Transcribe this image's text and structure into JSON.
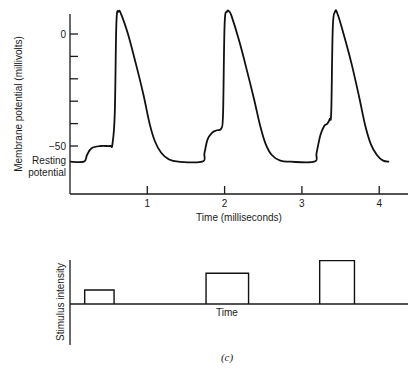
{
  "chart_data": [
    {
      "type": "line",
      "title": "",
      "xlabel": "Time (milliseconds)",
      "ylabel": "Membrane potential (millivolts)",
      "xlim": [
        0,
        4.4
      ],
      "ylim": [
        -71,
        10
      ],
      "x_ticks": [
        1,
        2,
        3,
        4
      ],
      "x_tick_labels": [
        "1",
        "2",
        "3",
        "4"
      ],
      "y_ticks": [
        0,
        -10,
        -20,
        -30,
        -40,
        -50
      ],
      "y_tick_labels": [
        "0",
        "",
        "",
        "",
        "",
        "−50"
      ],
      "annotations": [
        {
          "text": [
            "Resting",
            "potential"
          ],
          "y": -57
        }
      ],
      "grid": false,
      "series": [
        {
          "name": "Membrane potential",
          "x": [
            0,
            0.18,
            0.22,
            0.28,
            0.4,
            0.52,
            0.55,
            0.58,
            0.6,
            0.63,
            0.66,
            0.75,
            0.85,
            0.95,
            1.03,
            1.1,
            1.18,
            1.28,
            1.4,
            1.71,
            1.74,
            1.78,
            1.84,
            1.9,
            1.96,
            1.98,
            2.0,
            2.03,
            2.06,
            2.09,
            2.18,
            2.28,
            2.38,
            2.46,
            2.53,
            2.61,
            2.72,
            2.85,
            3.16,
            3.19,
            3.24,
            3.29,
            3.33,
            3.36,
            3.38,
            3.4,
            3.43,
            3.46,
            3.54,
            3.64,
            3.74,
            3.82,
            3.89,
            3.97,
            4.05,
            4.13
          ],
          "y": [
            -57,
            -57,
            -54,
            -51,
            -50,
            -50,
            -49,
            -35,
            5,
            10,
            9,
            0,
            -13,
            -27,
            -40,
            -48,
            -53,
            -56,
            -57,
            -57,
            -53,
            -47,
            -44,
            -43,
            -42,
            -35,
            4,
            10,
            10,
            8,
            -2,
            -15,
            -29,
            -41,
            -49,
            -54,
            -56.5,
            -57,
            -57,
            -53,
            -45,
            -41,
            -40,
            -38,
            -34,
            3,
            10,
            9,
            0,
            -13,
            -28,
            -41,
            -49,
            -54,
            -56.5,
            -57
          ]
        }
      ]
    },
    {
      "type": "bar",
      "title": "",
      "xlabel": "Time",
      "ylabel": "Stimulus intensity",
      "categories": [
        "Stimulus 1",
        "Stimulus 2",
        "Stimulus 3"
      ],
      "values": [
        1.0,
        2.2,
        3.1
      ],
      "units": "relative",
      "x_start_ms": [
        0.19,
        1.76,
        3.23
      ],
      "x_end_ms": [
        0.57,
        2.31,
        3.68
      ],
      "grid": false
    }
  ],
  "caption": "(c)"
}
